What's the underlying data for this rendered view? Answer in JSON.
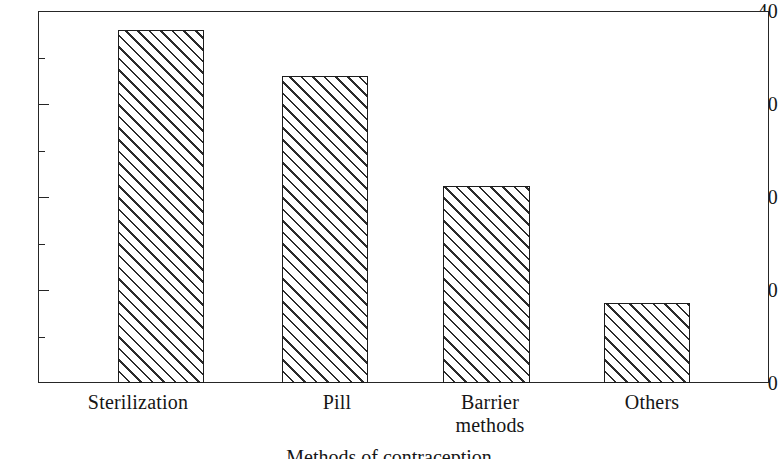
{
  "chart_data": {
    "type": "bar",
    "title": "",
    "subtitle": "",
    "xlabel": "Methods of contraception",
    "ylabel": "",
    "categories": [
      "Sterilization",
      "Pill",
      "Barrier\nmethods",
      "Others"
    ],
    "values": [
      38.0,
      33.0,
      21.2,
      8.6
    ],
    "series": [
      {
        "name": "Percentage",
        "values": [
          38.0,
          33.0,
          21.2,
          8.6
        ]
      }
    ],
    "ylim": [
      0,
      40
    ],
    "y_major_ticks": [
      0,
      10,
      20,
      30,
      40
    ],
    "y_minor_ticks": [
      5,
      15,
      25,
      35
    ],
    "y_tick_labels": [
      "0",
      "10",
      "20",
      "30",
      "40"
    ],
    "grid": false,
    "legend": false,
    "legend_position": "none",
    "bar_fill": "diagonal-hatch",
    "bar_edge_color": "#1d1d1d",
    "bar_face_color": "#ffffff",
    "axis_color": "#262626",
    "annotations": []
  },
  "figure": {
    "frame_name": "plot-area",
    "background": "#ffffff"
  },
  "axis": {
    "x_title": "Methods of contraception",
    "ticks": [
      {
        "label": "40",
        "value": 40,
        "major": true
      },
      {
        "label": "",
        "value": 35,
        "major": false
      },
      {
        "label": "30",
        "value": 30,
        "major": true
      },
      {
        "label": "",
        "value": 25,
        "major": false
      },
      {
        "label": "20",
        "value": 20,
        "major": true
      },
      {
        "label": "",
        "value": 15,
        "major": false
      },
      {
        "label": "10",
        "value": 10,
        "major": true
      },
      {
        "label": "",
        "value": 5,
        "major": false
      },
      {
        "label": "0",
        "value": 0,
        "major": true
      }
    ]
  },
  "bars": [
    {
      "label": "Sterilization",
      "value": 38.0,
      "left": 80,
      "width": 86
    },
    {
      "label": "Pill",
      "value": 33.0,
      "left": 244,
      "width": 86
    },
    {
      "label": "Barrier\nmethods",
      "value": 21.2,
      "left": 405,
      "width": 87
    },
    {
      "label": "Others",
      "value": 8.6,
      "left": 566,
      "width": 86
    }
  ]
}
